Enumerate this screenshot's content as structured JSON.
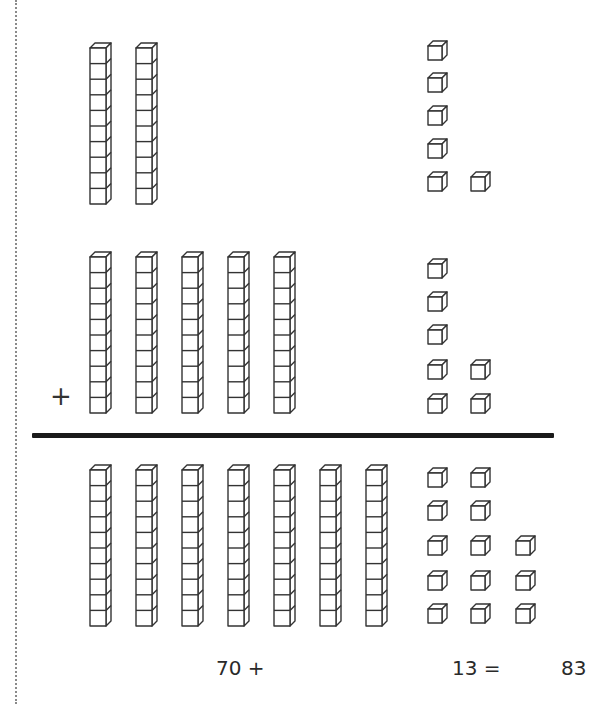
{
  "problem": {
    "addend1": {
      "tens": 2,
      "ones": 6,
      "value": 26
    },
    "addend2": {
      "tens": 5,
      "ones": 7,
      "value": 57
    },
    "sum": {
      "tens": 7,
      "ones": 13,
      "value": 83
    }
  },
  "operator_symbol": "+",
  "equation": {
    "tens_part": "70 +",
    "ones_part": "13 =",
    "result": "83"
  },
  "layout": {
    "rod_x": [
      90,
      136,
      182,
      228,
      274,
      320,
      366
    ],
    "cube_x": [
      428,
      471,
      516
    ],
    "rows": [
      {
        "id": "addend1",
        "rod_top": 43,
        "rods": 2,
        "cubes": [
          {
            "col": 0,
            "y": 41
          },
          {
            "col": 0,
            "y": 73
          },
          {
            "col": 0,
            "y": 106
          },
          {
            "col": 0,
            "y": 139
          },
          {
            "col": 0,
            "y": 172
          },
          {
            "col": 1,
            "y": 172
          }
        ]
      },
      {
        "id": "addend2",
        "rod_top": 252,
        "rods": 5,
        "cubes": [
          {
            "col": 0,
            "y": 259
          },
          {
            "col": 0,
            "y": 292
          },
          {
            "col": 0,
            "y": 325
          },
          {
            "col": 0,
            "y": 360
          },
          {
            "col": 1,
            "y": 360
          },
          {
            "col": 0,
            "y": 394
          },
          {
            "col": 1,
            "y": 394
          }
        ]
      },
      {
        "id": "sum",
        "rod_top": 465,
        "rods": 7,
        "cubes": [
          {
            "col": 0,
            "y": 468
          },
          {
            "col": 1,
            "y": 468
          },
          {
            "col": 0,
            "y": 501
          },
          {
            "col": 1,
            "y": 501
          },
          {
            "col": 0,
            "y": 536
          },
          {
            "col": 1,
            "y": 536
          },
          {
            "col": 2,
            "y": 536
          },
          {
            "col": 0,
            "y": 571
          },
          {
            "col": 1,
            "y": 571
          },
          {
            "col": 2,
            "y": 571
          },
          {
            "col": 0,
            "y": 604
          },
          {
            "col": 1,
            "y": 604
          },
          {
            "col": 2,
            "y": 604
          }
        ]
      }
    ]
  },
  "colors": {
    "stroke": "#333333",
    "divider": "#1a1a1a",
    "text": "#2a2a2a"
  }
}
